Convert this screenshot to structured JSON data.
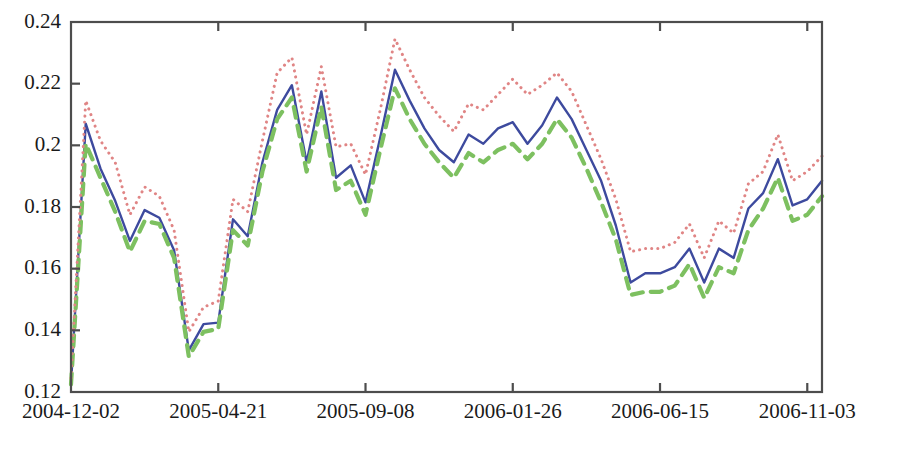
{
  "chart_data": {
    "type": "line",
    "title": "",
    "subtitle": "",
    "xlabel": "",
    "ylabel": "",
    "grid": false,
    "legend": "none",
    "xlim": [
      0,
      51
    ],
    "ylim": [
      0.12,
      0.24
    ],
    "ytick_labels": [
      "0.24",
      "0.22",
      "0.2",
      "0.18",
      "0.16",
      "0.14",
      "0.12"
    ],
    "ytick_values": [
      0.24,
      0.22,
      0.2,
      0.18,
      0.16,
      0.14,
      0.12
    ],
    "xtick_labels": [
      "2004-12-02",
      "2005-04-21",
      "2005-09-08",
      "2006-01-26",
      "2006-06-15",
      "2006-11-03"
    ],
    "xtick_values": [
      0,
      10,
      20,
      30,
      40,
      50
    ],
    "x": [
      0,
      1,
      2,
      3,
      4,
      5,
      6,
      7,
      8,
      9,
      10,
      11,
      12,
      13,
      14,
      15,
      16,
      17,
      18,
      19,
      20,
      21,
      22,
      23,
      24,
      25,
      26,
      27,
      28,
      29,
      30,
      31,
      32,
      33,
      34,
      35,
      36,
      37,
      38,
      39,
      40,
      41,
      42,
      43,
      44,
      45,
      46,
      47,
      48,
      49,
      50,
      51
    ],
    "series": [
      {
        "name": "solid-blue-series",
        "style": "solid",
        "color": "#3d4a9e",
        "values": [
          0.1225,
          0.207,
          0.1925,
          0.182,
          0.169,
          0.179,
          0.1765,
          0.166,
          0.1335,
          0.142,
          0.1425,
          0.176,
          0.1705,
          0.1945,
          0.2115,
          0.2195,
          0.1945,
          0.2175,
          0.1895,
          0.1935,
          0.1815,
          0.2025,
          0.2245,
          0.2145,
          0.2055,
          0.1985,
          0.1945,
          0.2035,
          0.2005,
          0.2055,
          0.2075,
          0.2005,
          0.2065,
          0.2155,
          0.2085,
          0.1985,
          0.1885,
          0.174,
          0.1555,
          0.1585,
          0.1585,
          0.1605,
          0.1665,
          0.1555,
          0.1665,
          0.1635,
          0.1795,
          0.1845,
          0.1955,
          0.1805,
          0.1825,
          0.1885
        ]
      },
      {
        "name": "dashed-green-series",
        "style": "dashed",
        "color": "#7dc060",
        "values": [
          0.1225,
          0.2005,
          0.1895,
          0.1785,
          0.1655,
          0.1755,
          0.1745,
          0.1635,
          0.1315,
          0.1395,
          0.1405,
          0.1725,
          0.1675,
          0.1915,
          0.2085,
          0.2155,
          0.1915,
          0.2125,
          0.1855,
          0.1885,
          0.1775,
          0.1985,
          0.2185,
          0.2085,
          0.2005,
          0.1945,
          0.1895,
          0.1975,
          0.1945,
          0.1985,
          0.2005,
          0.1955,
          0.2005,
          0.2085,
          0.2025,
          0.1925,
          0.1815,
          0.1695,
          0.1515,
          0.1525,
          0.1525,
          0.1545,
          0.1615,
          0.1505,
          0.1605,
          0.1585,
          0.1725,
          0.1795,
          0.1895,
          0.1755,
          0.1775,
          0.1835
        ]
      },
      {
        "name": "dotted-red-series",
        "style": "dotted",
        "color": "#e08585",
        "values": [
          0.1245,
          0.2145,
          0.2015,
          0.1945,
          0.1775,
          0.1865,
          0.1835,
          0.1725,
          0.1395,
          0.1475,
          0.1495,
          0.1825,
          0.1785,
          0.2015,
          0.2235,
          0.2285,
          0.2035,
          0.2255,
          0.1995,
          0.2005,
          0.1905,
          0.2115,
          0.2345,
          0.2245,
          0.2155,
          0.2095,
          0.2045,
          0.2135,
          0.2115,
          0.2165,
          0.2215,
          0.2165,
          0.2195,
          0.2235,
          0.2175,
          0.2065,
          0.1955,
          0.1825,
          0.1655,
          0.1665,
          0.1665,
          0.1685,
          0.1745,
          0.1635,
          0.1755,
          0.1715,
          0.1875,
          0.1915,
          0.2035,
          0.1885,
          0.1915,
          0.1965
        ]
      }
    ]
  },
  "figure": {
    "background_color": "#ffffff",
    "axis_color": "#4d4d4d"
  }
}
